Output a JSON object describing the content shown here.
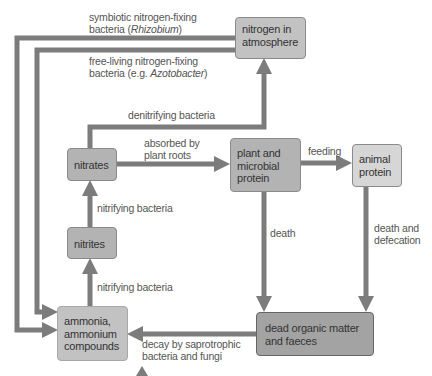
{
  "diagram": {
    "colors": {
      "arrow": "#7c7c7c",
      "box_light": "#d6d6d6",
      "box_mid": "#c2c2c2",
      "box_dark": "#a3a3a3",
      "text": "#333333",
      "label_text": "#555555"
    },
    "nodes": {
      "nitrogen_atmosphere": {
        "line1": "nitrogen in",
        "line2": "atmosphere"
      },
      "nitrates": {
        "label": "nitrates"
      },
      "nitrites": {
        "label": "nitrites"
      },
      "ammonia": {
        "line1": "ammonia,",
        "line2": "ammonium",
        "line3": "compounds"
      },
      "plant_protein": {
        "line1": "plant and",
        "line2": "microbial",
        "line3": "protein"
      },
      "animal_protein": {
        "line1": "animal",
        "line2": "protein"
      },
      "dead_matter": {
        "line1": "dead organic matter",
        "line2": "and faeces"
      }
    },
    "edges": {
      "symbiotic": {
        "line1": "symbiotic nitrogen-fixing",
        "line2_pre": "bacteria (",
        "line2_italic": "Rhizobium",
        "line2_post": ")"
      },
      "free_living": {
        "line1": "free-living nitrogen-fixing",
        "line2_pre": "bacteria (e.g. ",
        "line2_italic": "Azotobacter",
        "line2_post": ")"
      },
      "denitrifying": {
        "label": "denitrifying bacteria"
      },
      "absorbed": {
        "line1": "absorbed by",
        "line2": "plant roots"
      },
      "feeding": {
        "label": "feeding"
      },
      "nitrifying_upper": {
        "label": "nitrifying bacteria"
      },
      "nitrifying_lower": {
        "label": "nitrifying bacteria"
      },
      "death": {
        "label": "death"
      },
      "death_defecation": {
        "line1": "death and",
        "line2": "defecation"
      },
      "decay": {
        "line1": "decay by saprotrophic",
        "line2": "bacteria and fungi"
      }
    }
  }
}
